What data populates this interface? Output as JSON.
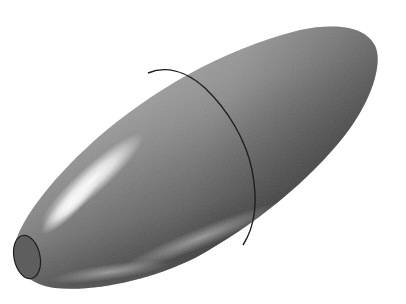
{
  "scene": {
    "subject": "3D-rendered bullet-shaped ellipsoid solid",
    "background_color": "#ffffff",
    "body": {
      "base_color": "#8a8a8a",
      "shadow_color": "#4a4a4a",
      "highlight_color": "#f4f4f4",
      "seam_color": "#1e1e1e"
    },
    "tip_cap": {
      "color": "#5e5e5e",
      "outline_color": "#1e1e1e"
    }
  }
}
